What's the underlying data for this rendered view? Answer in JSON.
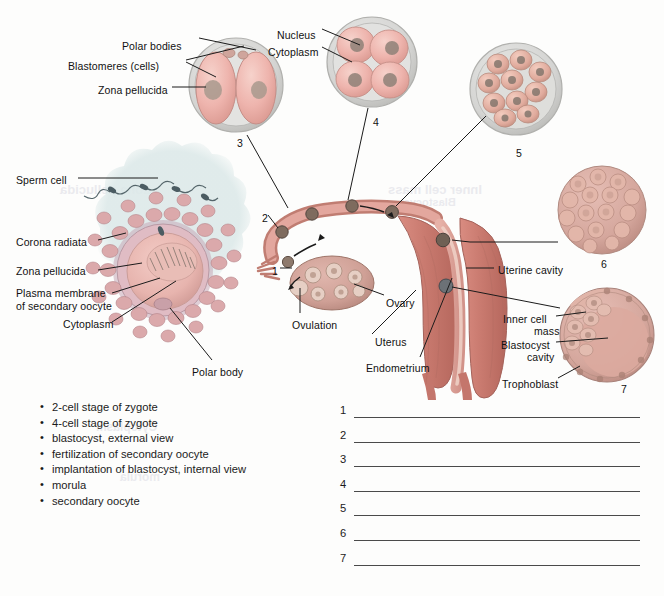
{
  "figure": {
    "background_color": "#fdfdfc"
  },
  "ghost_text": [
    {
      "text": "Inner cell mass",
      "x": 388,
      "y": 182,
      "size": 13
    },
    {
      "text": "Blastocyst",
      "x": 400,
      "y": 196,
      "size": 11
    },
    {
      "text": "Zona pellucida",
      "x": 60,
      "y": 182,
      "size": 13
    },
    {
      "text": "Cytoplasm",
      "x": 96,
      "y": 420,
      "size": 12
    },
    {
      "text": "morula",
      "x": 120,
      "y": 470,
      "size": 12
    }
  ],
  "labels": [
    {
      "id": "polar-bodies",
      "text": "Polar bodies",
      "x": 122,
      "y": 40,
      "align": "right",
      "anchor_x": 196
    },
    {
      "id": "blastomeres",
      "text": "Blastomeres (cells)",
      "x": 68,
      "y": 60,
      "align": "right",
      "anchor_x": 196
    },
    {
      "id": "zona-pellucida-top",
      "text": "Zona pellucida",
      "x": 98,
      "y": 84,
      "align": "right",
      "anchor_x": 196
    },
    {
      "id": "nucleus",
      "text": "Nucleus",
      "x": 277,
      "y": 29,
      "align": "right",
      "anchor_x": 330
    },
    {
      "id": "cytoplasm-top",
      "text": "Cytoplasm",
      "x": 268,
      "y": 46,
      "align": "right",
      "anchor_x": 330
    },
    {
      "id": "sperm-cell",
      "text": "Sperm cell",
      "x": 16,
      "y": 174,
      "align": "left",
      "anchor_x": 80
    },
    {
      "id": "corona-radiata",
      "text": "Corona radiata",
      "x": 16,
      "y": 236,
      "align": "left",
      "anchor_x": 96
    },
    {
      "id": "zona-pellucida-left",
      "text": "Zona pellucida",
      "x": 16,
      "y": 265,
      "align": "left",
      "anchor_x": 96
    },
    {
      "id": "plasma-membrane",
      "text": "Plasma membrane",
      "x": 16,
      "y": 287,
      "align": "left",
      "anchor_x": 110
    },
    {
      "id": "plasma-membrane-2",
      "text": "of secondary oocyte",
      "x": 16,
      "y": 300,
      "align": "left",
      "anchor_x": 110
    },
    {
      "id": "cytoplasm-left",
      "text": "Cytoplasm",
      "x": 63,
      "y": 318,
      "align": "left",
      "anchor_x": 110
    },
    {
      "id": "polar-body",
      "text": "Polar body",
      "x": 192,
      "y": 366,
      "align": "left",
      "anchor_x": 192
    },
    {
      "id": "ovulation",
      "text": "Ovulation",
      "x": 292,
      "y": 319,
      "align": "left",
      "anchor_x": 304
    },
    {
      "id": "ovary",
      "text": "Ovary",
      "x": 386,
      "y": 297,
      "align": "left",
      "anchor_x": 386
    },
    {
      "id": "uterus",
      "text": "Uterus",
      "x": 375,
      "y": 336,
      "align": "left",
      "anchor_x": 375
    },
    {
      "id": "endometrium",
      "text": "Endometrium",
      "x": 366,
      "y": 362,
      "align": "left",
      "anchor_x": 366
    },
    {
      "id": "uterine-cavity",
      "text": "Uterine cavity",
      "x": 498,
      "y": 264,
      "align": "left",
      "anchor_x": 498
    },
    {
      "id": "inner-cell-mass",
      "text": "Inner cell",
      "x": 503,
      "y": 313,
      "align": "left",
      "anchor_x": 560
    },
    {
      "id": "inner-cell-mass-2",
      "text": "mass",
      "x": 534,
      "y": 325,
      "align": "left",
      "anchor_x": 560
    },
    {
      "id": "blastocyst-cavity",
      "text": "Blastocyst",
      "x": 501,
      "y": 339,
      "align": "left",
      "anchor_x": 560
    },
    {
      "id": "blastocyst-cavity-2",
      "text": "cavity",
      "x": 527,
      "y": 351,
      "align": "left",
      "anchor_x": 560
    },
    {
      "id": "trophoblast",
      "text": "Trophoblast",
      "x": 502,
      "y": 378,
      "align": "left",
      "anchor_x": 560
    }
  ],
  "stage_numbers": [
    {
      "id": "stage-1",
      "value": "1",
      "x": 272,
      "y": 265
    },
    {
      "id": "stage-2",
      "value": "2",
      "x": 262,
      "y": 212
    },
    {
      "id": "stage-3",
      "value": "3",
      "x": 237,
      "y": 137
    },
    {
      "id": "stage-4",
      "value": "4",
      "x": 373,
      "y": 116
    },
    {
      "id": "stage-5",
      "value": "5",
      "x": 516,
      "y": 147
    },
    {
      "id": "stage-6",
      "value": "6",
      "x": 601,
      "y": 258
    },
    {
      "id": "stage-7",
      "value": "7",
      "x": 621,
      "y": 383
    }
  ],
  "word_bank": {
    "items": [
      "2-cell stage of zygote",
      "4-cell stage of zygote",
      "blastocyst, external view",
      "fertilization of secondary oocyte",
      "implantation of blastocyst, internal view",
      "morula",
      "secondary oocyte"
    ]
  },
  "answer_lines": {
    "numbers": [
      "1",
      "2",
      "3",
      "4",
      "5",
      "6",
      "7"
    ],
    "values": [
      "",
      "",
      "",
      "",
      "",
      "",
      ""
    ]
  },
  "colors": {
    "cell_pink": "#eeb4ad",
    "cell_pink_dark": "#d08d87",
    "zona_grey": "#cfcfce",
    "tissue_pink": "#d9877f",
    "tissue_pink_light": "#e6a9a1",
    "uterus_red": "#cf7a72",
    "corona_blue": "#dde8e8",
    "nucleus_grey": "#8e8077",
    "line_color": "#1b1b1b",
    "answer_line": "#4a4a4a"
  }
}
